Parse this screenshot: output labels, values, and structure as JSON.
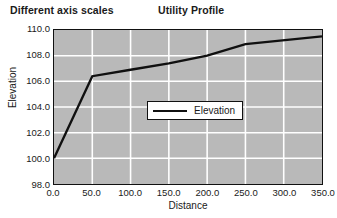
{
  "caption": "Different axis scales",
  "chart_title": "Utility  Profile",
  "legend": {
    "position": "inside-lower-right",
    "entries": [
      "Elevation"
    ]
  },
  "axes": {
    "x": {
      "label": "Distance",
      "ticks": [
        "0.0",
        "50.0",
        "100.0",
        "150.0",
        "200.0",
        "250.0",
        "300.0",
        "350.0"
      ],
      "min": 0,
      "max": 350,
      "step": 50
    },
    "y": {
      "label": "Elevation",
      "ticks": [
        "110.0",
        "108.0",
        "106.0",
        "104.0",
        "102.0",
        "100.0",
        "98.0"
      ],
      "min": 98,
      "max": 110,
      "step": 2
    }
  },
  "style": {
    "plot_background": "#b9b9b9",
    "gridline_color": "#ffffff",
    "series_color": "#101010",
    "frame_color": "#111111",
    "page_background": "#ffffff"
  },
  "chart_data": {
    "type": "line",
    "title": "Utility  Profile",
    "xlabel": "Distance",
    "ylabel": "Elevation",
    "xlim": [
      0,
      350
    ],
    "ylim": [
      98,
      110
    ],
    "grid": true,
    "legend_position": "inside lower right",
    "series": [
      {
        "name": "Elevation",
        "color": "#101010",
        "x": [
          0,
          50,
          100,
          150,
          200,
          250,
          350
        ],
        "y": [
          100.0,
          106.4,
          106.9,
          107.4,
          108.0,
          108.9,
          109.5
        ]
      }
    ]
  }
}
